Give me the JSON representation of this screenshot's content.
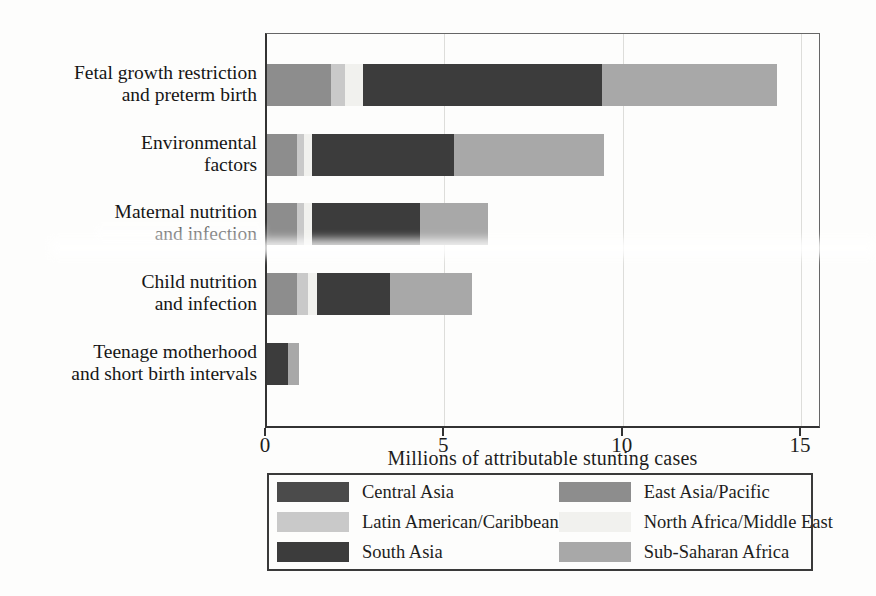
{
  "chart_data": {
    "type": "bar",
    "orientation": "horizontal",
    "stacked": true,
    "xlabel": "Millions of attributable stunting cases",
    "xticks": [
      0,
      5,
      10,
      15
    ],
    "xlim": [
      0,
      15.56
    ],
    "grid": "vertical light gridlines at 5, 10, 15",
    "legend_position": "boxed legend below axis, 2 columns x 3 rows",
    "categories": [
      [
        "Fetal growth restriction",
        "and preterm birth"
      ],
      [
        "Environmental",
        "factors"
      ],
      [
        "Maternal nutrition",
        "and infection"
      ],
      [
        "Child nutrition",
        "and infection"
      ],
      [
        "Teenage motherhood",
        "and short birth intervals"
      ]
    ],
    "series": [
      {
        "name": "Central Asia",
        "color": "#4b4b4b",
        "values": [
          0,
          0,
          0,
          0,
          0
        ]
      },
      {
        "name": "East Asia/Pacific",
        "color": "#8d8d8d",
        "values": [
          1.8,
          0.85,
          0.85,
          0.85,
          0
        ]
      },
      {
        "name": "Latin American/Caribbean",
        "color": "#c9c9c9",
        "values": [
          0.4,
          0.2,
          0.2,
          0.3,
          0
        ]
      },
      {
        "name": "North Africa/Middle East",
        "color": "#f1f1ee",
        "values": [
          0.5,
          0.2,
          0.2,
          0.25,
          0
        ]
      },
      {
        "name": "South Asia",
        "color": "#3c3c3c",
        "values": [
          6.7,
          4.0,
          3.05,
          2.05,
          0.6
        ]
      },
      {
        "name": "Sub-Saharan Africa",
        "color": "#a8a8a8",
        "values": [
          4.9,
          4.2,
          1.9,
          2.3,
          0.3
        ]
      }
    ],
    "bar_totals": [
      14.3,
      9.45,
      6.2,
      5.75,
      0.9
    ]
  },
  "legend": {
    "items": [
      {
        "label": "Central Asia",
        "color": "#4b4b4b"
      },
      {
        "label": "East Asia/Pacific",
        "color": "#8d8d8d"
      },
      {
        "label": "Latin American/Caribbean",
        "color": "#c9c9c9"
      },
      {
        "label": "North Africa/Middle East",
        "color": "#f1f1ee"
      },
      {
        "label": "South Asia",
        "color": "#3c3c3c"
      },
      {
        "label": "Sub-Saharan Africa",
        "color": "#a8a8a8"
      }
    ]
  }
}
